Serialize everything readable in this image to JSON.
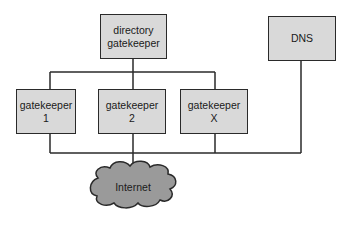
{
  "diagram": {
    "nodes": {
      "directory_gatekeeper": {
        "line1": "directory",
        "line2": "gatekeeper"
      },
      "dns": {
        "label": "DNS"
      },
      "gatekeeper_1": {
        "line1": "gatekeeper",
        "line2": "1"
      },
      "gatekeeper_2": {
        "line1": "gatekeeper",
        "line2": "2"
      },
      "gatekeeper_x": {
        "line1": "gatekeeper",
        "line2": "X"
      },
      "internet": {
        "label": "Internet"
      }
    },
    "edges": [
      {
        "from": "directory_gatekeeper",
        "to": "gatekeeper_1"
      },
      {
        "from": "directory_gatekeeper",
        "to": "gatekeeper_2"
      },
      {
        "from": "directory_gatekeeper",
        "to": "gatekeeper_x"
      },
      {
        "from": "gatekeeper_1",
        "to": "network_bus"
      },
      {
        "from": "gatekeeper_2",
        "to": "network_bus"
      },
      {
        "from": "gatekeeper_x",
        "to": "network_bus"
      },
      {
        "from": "dns",
        "to": "network_bus"
      },
      {
        "from": "network_bus",
        "to": "internet"
      }
    ],
    "colors": {
      "box_fill": "#d9d9d9",
      "cloud_fill": "#9a9a9a",
      "line": "#2a2a2a"
    }
  }
}
